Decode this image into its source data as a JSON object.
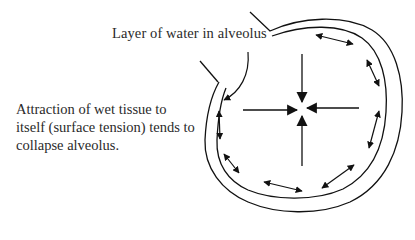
{
  "diagram": {
    "labels": {
      "water_layer": "Layer of water in alveolus",
      "surface_tension": {
        "line1": "Attraction of wet tissue to",
        "line2": "itself (surface tension) tends to",
        "line3": "collapse alveolus."
      }
    },
    "elements": {
      "alveolus_outer_wall": "outer-wall",
      "alveolus_inner_wall": "inner-wall",
      "water_layer_pointer": "curved-pointer-arrow",
      "inward_arrows": [
        "from-top",
        "from-bottom",
        "from-left",
        "from-right"
      ],
      "tension_double_arrows_count": 9
    },
    "colors": {
      "stroke": "#111111",
      "text": "#2a2a2a",
      "background": "#ffffff"
    }
  }
}
